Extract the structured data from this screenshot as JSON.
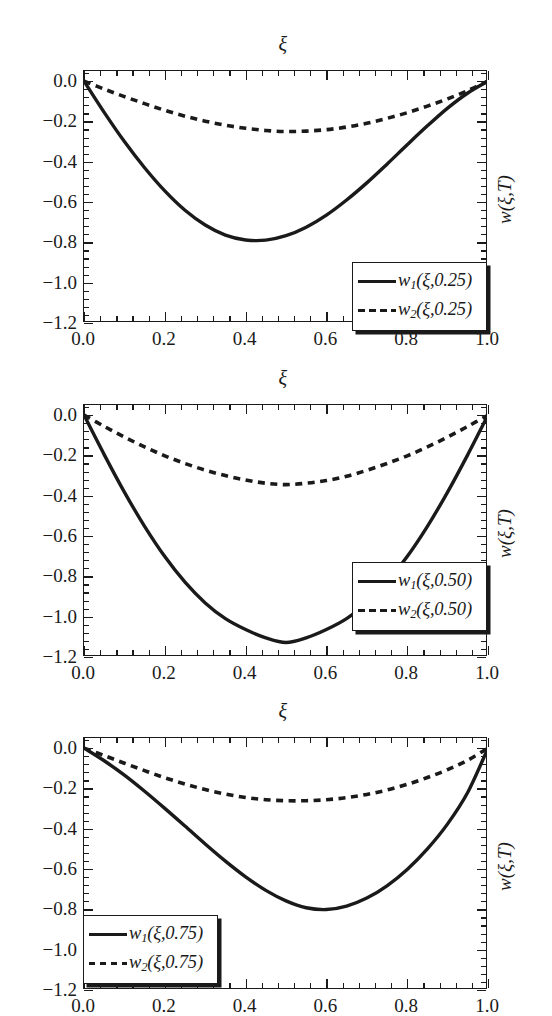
{
  "figure": {
    "panel_count": 3,
    "background": "#ffffff",
    "ink": "#1a1a1a"
  },
  "chart_data": [
    {
      "type": "line",
      "title": "",
      "xlabel": "ξ",
      "ylabel": "w(ξ,T)",
      "xlabel_position": "top",
      "ylabel_position": "right-rotated",
      "grid": false,
      "legend_position": "bottom-right",
      "xlim": [
        0.0,
        1.0
      ],
      "ylim": [
        -1.2,
        0.05
      ],
      "xticks": [
        "0.0",
        "0.2",
        "0.4",
        "0.6",
        "0.8",
        "1.0"
      ],
      "xtick_values": [
        0.0,
        0.2,
        0.4,
        0.6,
        0.8,
        1.0
      ],
      "yticks": [
        "0.0",
        "-0.2",
        "-0.4",
        "-0.6",
        "-0.8",
        "-1.0",
        "-1.2"
      ],
      "ytick_values": [
        0.0,
        -0.2,
        -0.4,
        -0.6,
        -0.8,
        -1.0,
        -1.2
      ],
      "minor_ticks_per_interval": 4,
      "series": [
        {
          "name": "w_1(ξ,0.25)",
          "label_base": "w",
          "label_sub": "1",
          "label_args": "(ξ,0.25)",
          "style": "solid",
          "color": "#1a1a1a",
          "minimum": {
            "x": 0.44,
            "y": -0.79
          },
          "x": [
            0.0,
            0.05,
            0.1,
            0.15,
            0.2,
            0.25,
            0.3,
            0.35,
            0.4,
            0.45,
            0.5,
            0.55,
            0.6,
            0.65,
            0.7,
            0.75,
            0.8,
            0.85,
            0.9,
            0.95,
            1.0
          ],
          "y": [
            0.0,
            -0.155,
            -0.3,
            -0.43,
            -0.545,
            -0.641,
            -0.714,
            -0.764,
            -0.788,
            -0.789,
            -0.767,
            -0.725,
            -0.665,
            -0.59,
            -0.505,
            -0.412,
            -0.316,
            -0.222,
            -0.134,
            -0.059,
            0.0
          ]
        },
        {
          "name": "w_2(ξ,0.25)",
          "label_base": "w",
          "label_sub": "2",
          "label_args": "(ξ,0.25)",
          "style": "dashed",
          "color": "#1a1a1a",
          "minimum": {
            "x": 0.49,
            "y": -0.25
          },
          "x": [
            0.0,
            0.05,
            0.1,
            0.15,
            0.2,
            0.25,
            0.3,
            0.35,
            0.4,
            0.45,
            0.5,
            0.55,
            0.6,
            0.65,
            0.7,
            0.75,
            0.8,
            0.85,
            0.9,
            0.95,
            1.0
          ],
          "y": [
            0.0,
            -0.04,
            -0.077,
            -0.112,
            -0.145,
            -0.174,
            -0.199,
            -0.219,
            -0.234,
            -0.245,
            -0.25,
            -0.248,
            -0.241,
            -0.228,
            -0.209,
            -0.185,
            -0.157,
            -0.124,
            -0.088,
            -0.047,
            0.0
          ]
        }
      ]
    },
    {
      "type": "line",
      "title": "",
      "xlabel": "ξ",
      "ylabel": "w(ξ,T)",
      "xlabel_position": "top",
      "ylabel_position": "right-rotated",
      "grid": false,
      "legend_position": "bottom-right",
      "xlim": [
        0.0,
        1.0
      ],
      "ylim": [
        -1.2,
        0.05
      ],
      "xticks": [
        "0.0",
        "0.2",
        "0.4",
        "0.6",
        "0.8",
        "1.0"
      ],
      "xtick_values": [
        0.0,
        0.2,
        0.4,
        0.6,
        0.8,
        1.0
      ],
      "yticks": [
        "0.0",
        "-0.2",
        "-0.4",
        "-0.6",
        "-0.8",
        "-1.0",
        "-1.2"
      ],
      "ytick_values": [
        0.0,
        -0.2,
        -0.4,
        -0.6,
        -0.8,
        -1.0,
        -1.2
      ],
      "minor_ticks_per_interval": 4,
      "series": [
        {
          "name": "w_1(ξ,0.50)",
          "label_base": "w",
          "label_sub": "1",
          "label_args": "(ξ,0.50)",
          "style": "solid",
          "color": "#1a1a1a",
          "minimum": {
            "x": 0.5,
            "y": -1.13
          },
          "x": [
            0.0,
            0.05,
            0.1,
            0.15,
            0.2,
            0.25,
            0.3,
            0.35,
            0.4,
            0.45,
            0.5,
            0.55,
            0.6,
            0.65,
            0.7,
            0.75,
            0.8,
            0.85,
            0.9,
            0.95,
            1.0
          ],
          "y": [
            0.0,
            -0.196,
            -0.382,
            -0.552,
            -0.702,
            -0.829,
            -0.932,
            -1.01,
            -1.064,
            -1.105,
            -1.128,
            -1.105,
            -1.064,
            -1.01,
            -0.932,
            -0.829,
            -0.702,
            -0.552,
            -0.382,
            -0.196,
            0.0
          ]
        },
        {
          "name": "w_2(ξ,0.50)",
          "label_base": "w",
          "label_sub": "2",
          "label_args": "(ξ,0.50)",
          "style": "dashed",
          "color": "#1a1a1a",
          "minimum": {
            "x": 0.5,
            "y": -0.345
          },
          "x": [
            0.0,
            0.05,
            0.1,
            0.15,
            0.2,
            0.25,
            0.3,
            0.35,
            0.4,
            0.45,
            0.5,
            0.55,
            0.6,
            0.65,
            0.7,
            0.75,
            0.8,
            0.85,
            0.9,
            0.95,
            1.0
          ],
          "y": [
            0.0,
            -0.056,
            -0.109,
            -0.158,
            -0.202,
            -0.24,
            -0.273,
            -0.3,
            -0.322,
            -0.338,
            -0.345,
            -0.338,
            -0.325,
            -0.303,
            -0.274,
            -0.24,
            -0.202,
            -0.158,
            -0.109,
            -0.056,
            0.0
          ]
        }
      ]
    },
    {
      "type": "line",
      "title": "",
      "xlabel": "ξ",
      "ylabel": "w(ξ,T)",
      "xlabel_position": "top",
      "ylabel_position": "right-rotated",
      "grid": false,
      "legend_position": "bottom-left",
      "xlim": [
        0.0,
        1.0
      ],
      "ylim": [
        -1.2,
        0.05
      ],
      "xticks": [
        "0.0",
        "0.2",
        "0.4",
        "0.6",
        "0.8",
        "1.0"
      ],
      "xtick_values": [
        0.0,
        0.2,
        0.4,
        0.6,
        0.8,
        1.0
      ],
      "yticks": [
        "0.0",
        "-0.2",
        "-0.4",
        "-0.6",
        "-0.8",
        "-1.0",
        "-1.2"
      ],
      "ytick_values": [
        0.0,
        -0.2,
        -0.4,
        -0.6,
        -0.8,
        -1.0,
        -1.2
      ],
      "minor_ticks_per_interval": 4,
      "series": [
        {
          "name": "w_1(ξ,0.75)",
          "label_base": "w",
          "label_sub": "1",
          "label_args": "(ξ,0.75)",
          "style": "solid",
          "color": "#1a1a1a",
          "minimum": {
            "x": 0.55,
            "y": -0.8
          },
          "x": [
            0.0,
            0.05,
            0.1,
            0.15,
            0.2,
            0.25,
            0.3,
            0.35,
            0.4,
            0.45,
            0.5,
            0.55,
            0.6,
            0.65,
            0.7,
            0.75,
            0.8,
            0.85,
            0.9,
            0.95,
            1.0
          ],
          "y": [
            0.0,
            -0.063,
            -0.134,
            -0.214,
            -0.299,
            -0.387,
            -0.476,
            -0.561,
            -0.639,
            -0.706,
            -0.758,
            -0.792,
            -0.801,
            -0.784,
            -0.744,
            -0.683,
            -0.602,
            -0.5,
            -0.376,
            -0.219,
            0.0
          ]
        },
        {
          "name": "w_2(ξ,0.75)",
          "label_base": "w",
          "label_sub": "2",
          "label_args": "(ξ,0.75)",
          "style": "dashed",
          "color": "#1a1a1a",
          "minimum": {
            "x": 0.54,
            "y": -0.26
          },
          "x": [
            0.0,
            0.05,
            0.1,
            0.15,
            0.2,
            0.25,
            0.3,
            0.35,
            0.4,
            0.45,
            0.5,
            0.55,
            0.6,
            0.65,
            0.7,
            0.75,
            0.8,
            0.85,
            0.9,
            0.95,
            1.0
          ],
          "y": [
            0.0,
            -0.037,
            -0.075,
            -0.112,
            -0.147,
            -0.178,
            -0.206,
            -0.228,
            -0.245,
            -0.256,
            -0.261,
            -0.261,
            -0.256,
            -0.246,
            -0.23,
            -0.208,
            -0.18,
            -0.146,
            -0.107,
            -0.06,
            0.0
          ]
        }
      ]
    }
  ]
}
